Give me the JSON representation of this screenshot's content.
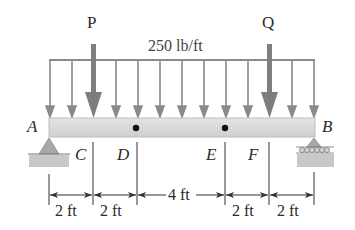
{
  "diagram": {
    "type": "beam-loading",
    "loads": {
      "point_load_left": "P",
      "point_load_right": "Q",
      "distributed_load": "250 lb/ft"
    },
    "points": {
      "A": "A",
      "B": "B",
      "C": "C",
      "D": "D",
      "E": "E",
      "F": "F"
    },
    "dimensions": [
      "2 ft",
      "2 ft",
      "4 ft",
      "2 ft",
      "2 ft"
    ],
    "colors": {
      "arrow": "#8a8a8a",
      "beam": "#d8d8d8",
      "ground": "#c4c4c4",
      "line": "#333333"
    }
  }
}
